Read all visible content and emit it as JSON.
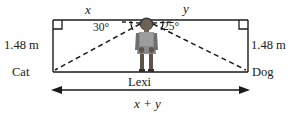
{
  "diagram": {
    "labels": {
      "side_x": "x",
      "side_y": "y",
      "angle_left": "30°",
      "angle_right": "25°",
      "height_left": "1.48 m",
      "height_right": "1.48 m",
      "left_object": "Cat",
      "right_object": "Dog",
      "person": "Lexi",
      "total_distance": "x + y"
    },
    "colors": {
      "line": "#1a1a1a",
      "dash": "#1a1a1a",
      "figure_dark": "#3b3b3b",
      "figure_mid": "#7a7a7a",
      "figure_light": "#9a9a9a",
      "background": "#ffffff"
    },
    "geometry": {
      "top_y": 20,
      "bottom_y": 72,
      "left_x": 53,
      "right_x": 248,
      "person_x": 146,
      "arrow_y": 90,
      "right_angle_box_size": 9
    }
  }
}
